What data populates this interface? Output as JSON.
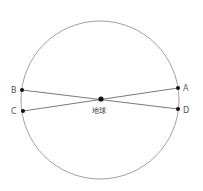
{
  "diagram": {
    "circle": {
      "cx": 100,
      "cy": 100,
      "r": 79,
      "stroke": "#888888"
    },
    "center": {
      "label": "地球",
      "x": 101,
      "y": 99
    },
    "points": [
      {
        "id": "A",
        "label": "A",
        "x": 178,
        "y": 88
      },
      {
        "id": "B",
        "label": "B",
        "x": 22,
        "y": 90
      },
      {
        "id": "C",
        "label": "C",
        "x": 23,
        "y": 111
      },
      {
        "id": "D",
        "label": "D",
        "x": 178,
        "y": 109
      }
    ],
    "lines": [
      {
        "from": "B",
        "to": "D"
      },
      {
        "from": "C",
        "to": "A"
      }
    ]
  }
}
